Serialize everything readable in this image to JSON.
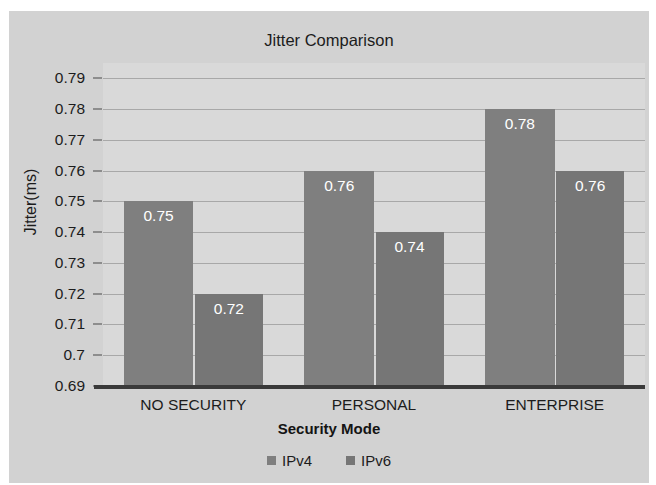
{
  "chart_data": {
    "type": "bar",
    "title": "Jitter Comparison",
    "xlabel": "Security Mode",
    "ylabel": "Jitter(ms)",
    "categories": [
      "NO SECURITY",
      "PERSONAL",
      "ENTERPRISE"
    ],
    "series": [
      {
        "name": "IPv4",
        "values": [
          0.75,
          0.76,
          0.78
        ],
        "labels": [
          "0.75",
          "0.76",
          "0.78"
        ],
        "color": "#7f7f7f"
      },
      {
        "name": "IPv6",
        "values": [
          0.72,
          0.74,
          0.76
        ],
        "labels": [
          "0.72",
          "0.74",
          "0.76"
        ],
        "color": "#767676"
      }
    ],
    "ylim": [
      0.69,
      0.795
    ],
    "yticks": [
      0.69,
      0.7,
      0.71,
      0.72,
      0.73,
      0.74,
      0.75,
      0.76,
      0.77,
      0.78,
      0.79
    ],
    "ytick_labels": [
      "0.69",
      "0.7",
      "0.71",
      "0.72",
      "0.73",
      "0.74",
      "0.75",
      "0.76",
      "0.77",
      "0.78",
      "0.79"
    ],
    "grid": true,
    "legend_position": "bottom",
    "plot_background": "#d9d9d9",
    "figure_background": "#d2d2d2",
    "grid_color": "#a8a8a8",
    "axis_color": "#3a3a3a",
    "text_color": "#1c1c1c",
    "datalabel_color": "#ffffff"
  },
  "legend": {
    "items": [
      {
        "label": "IPv4",
        "color": "#7f7f7f"
      },
      {
        "label": "IPv6",
        "color": "#767676"
      }
    ]
  }
}
